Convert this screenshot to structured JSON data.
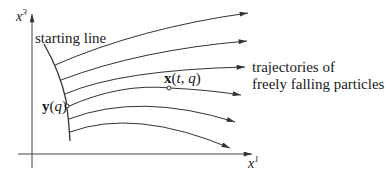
{
  "diagram": {
    "axes": {
      "vertical": {
        "label_var": "x",
        "label_sup": "3"
      },
      "horizontal": {
        "label_var": "x",
        "label_sup": "1"
      }
    },
    "labels": {
      "starting_line": "starting line",
      "trajectories_line1": "trajectories of",
      "trajectories_line2": "freely falling particles",
      "point_start": {
        "bold": "y",
        "rest": "(",
        "arg": "q",
        "close": ")"
      },
      "point_traj": {
        "bold": "x",
        "open": "(",
        "arg1": "t",
        "sep": ", ",
        "arg2": "q",
        "close": ")"
      }
    },
    "trajectory_count": 7,
    "colors": {
      "stroke": "#333333",
      "background": "#ffffff"
    }
  }
}
